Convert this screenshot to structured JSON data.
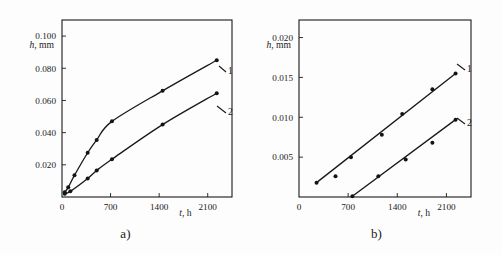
{
  "figure": {
    "panels": [
      {
        "id": "a",
        "caption": "a)",
        "y_axis": {
          "label_var": "h",
          "label_unit": ", mm",
          "ticks": [
            "0.020",
            "0.040",
            "0.060",
            "0.080",
            "0.100"
          ],
          "tick_values": [
            0.02,
            0.04,
            0.06,
            0.08,
            0.1
          ],
          "range": [
            0,
            0.11
          ]
        },
        "x_axis": {
          "label_var": "t",
          "label_unit": ", h",
          "ticks": [
            "0",
            "700",
            "1400",
            "2100"
          ],
          "tick_values": [
            0,
            700,
            1400,
            2100
          ],
          "range": [
            0,
            2450
          ]
        },
        "curve_labels": [
          "1",
          "2"
        ]
      },
      {
        "id": "b",
        "caption": "b)",
        "y_axis": {
          "label_var": "h",
          "label_unit": ", mm",
          "ticks": [
            "0.005",
            "0.010",
            "0.015",
            "0.020"
          ],
          "tick_values": [
            0.005,
            0.01,
            0.015,
            0.02
          ],
          "range": [
            0,
            0.0222
          ]
        },
        "x_axis": {
          "label_var": "t",
          "label_unit": ", h",
          "ticks": [
            "0",
            "700",
            "1400",
            "2100"
          ],
          "tick_values": [
            0,
            700,
            1400,
            2100
          ],
          "range": [
            0,
            2450
          ]
        },
        "curve_labels": [
          "1",
          "2"
        ]
      }
    ]
  },
  "chart_data": [
    {
      "type": "scatter",
      "title": "a)",
      "xlabel": "t, h",
      "ylabel": "h, mm",
      "xlim": [
        0,
        2450
      ],
      "ylim": [
        0,
        0.11
      ],
      "grid": false,
      "legend": "inline-curve-numbers",
      "series": [
        {
          "name": "1",
          "x": [
            40,
            90,
            180,
            370,
            500,
            720,
            1450,
            2230
          ],
          "y": [
            0.003,
            0.006,
            0.0135,
            0.0275,
            0.0355,
            0.047,
            0.066,
            0.085
          ]
        },
        {
          "name": "2",
          "x": [
            40,
            120,
            370,
            500,
            720,
            1450,
            2230
          ],
          "y": [
            0.002,
            0.0035,
            0.0115,
            0.0165,
            0.0235,
            0.045,
            0.0645
          ]
        }
      ]
    },
    {
      "type": "scatter",
      "title": "b)",
      "xlabel": "t, h",
      "ylabel": "h, mm",
      "xlim": [
        0,
        2450
      ],
      "ylim": [
        0,
        0.0222
      ],
      "grid": false,
      "legend": "inline-curve-numbers",
      "series": [
        {
          "name": "1",
          "x": [
            250,
            520,
            740,
            1180,
            1470,
            1900,
            2230
          ],
          "y": [
            0.0018,
            0.0026,
            0.005,
            0.0078,
            0.0104,
            0.0135,
            0.0155
          ]
        },
        {
          "name": "2",
          "x": [
            760,
            1130,
            1520,
            1900,
            2230
          ],
          "y": [
            0.0001,
            0.0026,
            0.0047,
            0.0068,
            0.0097
          ]
        }
      ]
    }
  ]
}
